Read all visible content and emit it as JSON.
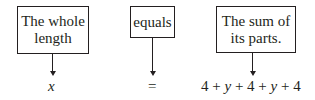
{
  "boxes": [
    {
      "label": "The whole length",
      "line1": "The whole",
      "line2": "length"
    },
    {
      "label": "equals"
    },
    {
      "label": "The sum of its parts.",
      "line1": "The sum of",
      "line2": "its parts."
    }
  ],
  "expressions": {
    "left": "x",
    "middle": "=",
    "right": "4 + y + 4 + y + 4"
  }
}
